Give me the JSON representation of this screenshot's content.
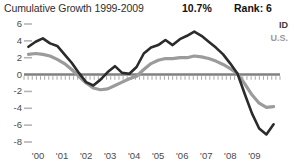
{
  "header": {
    "title": "Cumulative Growth 1999-2009",
    "value": "10.7%",
    "rank": "Rank: 6"
  },
  "legend": {
    "series_1": "ID",
    "series_2": "U.S."
  },
  "chart_data": {
    "type": "line",
    "title": "Cumulative Growth 1999-2009",
    "xlabel": "",
    "ylabel": "",
    "xlim": [
      1999.5,
      2009.9
    ],
    "ylim": [
      -8,
      6
    ],
    "yticks": [
      6,
      4,
      2,
      0,
      -2,
      -4,
      -6,
      -8
    ],
    "ytick_labels": [
      "6",
      "4",
      "2",
      "0",
      "-2",
      "-4",
      "-6",
      "-8"
    ],
    "xticks": [
      2000,
      2001,
      2002,
      2003,
      2004,
      2005,
      2006,
      2007,
      2008,
      2009
    ],
    "xtick_labels": [
      "'00",
      "'01",
      "'02",
      "'03",
      "'04",
      "'05",
      "'06",
      "'07",
      "'08",
      "'09"
    ],
    "grid": false,
    "zero_axis": true,
    "legend_position": "top-right",
    "colors": {
      "series_1": "#2b2b2b",
      "series_2": "#9b9b9b",
      "axis": "#808080",
      "text": "#4a4a4a"
    },
    "x": [
      1999.6,
      1999.9,
      2000.2,
      2000.5,
      2000.8,
      2001.1,
      2001.4,
      2001.7,
      2002.0,
      2002.3,
      2002.6,
      2002.9,
      2003.2,
      2003.5,
      2003.8,
      2004.1,
      2004.4,
      2004.7,
      2005.0,
      2005.3,
      2005.6,
      2005.9,
      2006.2,
      2006.5,
      2006.8,
      2007.1,
      2007.4,
      2007.7,
      2008.0,
      2008.3,
      2008.6,
      2008.9,
      2009.2,
      2009.5,
      2009.8
    ],
    "series": [
      {
        "name": "ID",
        "color": "#2b2b2b",
        "values": [
          3.3,
          3.9,
          4.3,
          3.7,
          3.4,
          2.4,
          1.4,
          0.2,
          -0.9,
          -1.3,
          -0.6,
          0.3,
          1.0,
          0.2,
          0.1,
          0.9,
          2.5,
          3.2,
          3.5,
          4.1,
          3.5,
          4.2,
          4.6,
          5.1,
          4.6,
          3.9,
          3.2,
          2.4,
          1.3,
          0.1,
          -2.3,
          -4.6,
          -6.4,
          -7.1,
          -5.9
        ]
      },
      {
        "name": "U.S.",
        "color": "#9b9b9b",
        "values": [
          2.4,
          2.5,
          2.4,
          2.2,
          1.8,
          1.3,
          0.6,
          -0.2,
          -1.0,
          -1.6,
          -1.8,
          -1.7,
          -1.3,
          -0.9,
          -0.5,
          -0.2,
          0.6,
          1.3,
          1.7,
          1.9,
          1.9,
          2.0,
          2.0,
          2.2,
          2.1,
          1.9,
          1.6,
          1.2,
          0.7,
          0.1,
          -1.1,
          -2.4,
          -3.4,
          -3.9,
          -3.8
        ]
      }
    ]
  }
}
